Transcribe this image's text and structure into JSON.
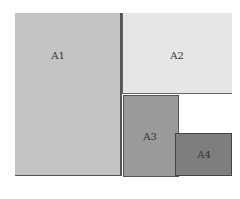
{
  "diagram": {
    "type": "area-partition",
    "regions": [
      {
        "id": "A1",
        "label": "A1",
        "color": "#c4c4c4"
      },
      {
        "id": "A2",
        "label": "A2",
        "color": "#e6e6e6"
      },
      {
        "id": "A3",
        "label": "A3",
        "color": "#9a9a9a"
      },
      {
        "id": "A4",
        "label": "A4",
        "color": "#7e7e7e"
      }
    ],
    "caption": ""
  }
}
